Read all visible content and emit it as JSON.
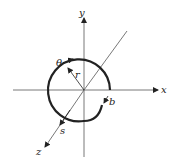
{
  "diagram": {
    "type": "spiral coordinate sketch",
    "axes": {
      "x_label": "x",
      "y_label": "y",
      "z_label": "z"
    },
    "labels": {
      "theta": "θ",
      "r": "r",
      "s": "s",
      "b": "b"
    },
    "colors": {
      "line": "#222222",
      "background": "#ffffff"
    }
  }
}
